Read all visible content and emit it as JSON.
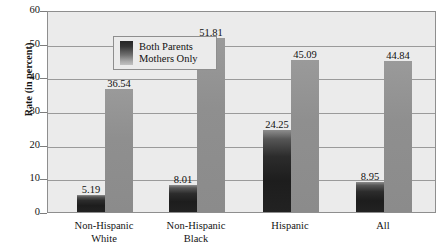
{
  "chart_data": {
    "type": "bar",
    "title": "",
    "xlabel": "",
    "ylabel": "Rate (in percent)",
    "ylim": [
      0,
      60
    ],
    "ytick_labels": [
      "0",
      "10",
      "20",
      "30",
      "40",
      "50",
      "60"
    ],
    "ytick_values": [
      0,
      10,
      20,
      30,
      40,
      50,
      60
    ],
    "grid": true,
    "legend_position": "top-left inside plot",
    "categories": [
      "Non-Hispanic White",
      "Non-Hispanic Black",
      "Hispanic",
      "All"
    ],
    "category_lines": [
      [
        "Non-Hispanic",
        "White"
      ],
      [
        "Non-Hispanic",
        "Black"
      ],
      [
        "Hispanic"
      ],
      [
        "All"
      ]
    ],
    "series": [
      {
        "name": "Both Parents",
        "color": "#1f1f1f",
        "values": [
          5.19,
          8.01,
          24.25,
          8.95
        ],
        "labels": [
          "5.19",
          "8.01",
          "24.25",
          "8.95"
        ]
      },
      {
        "name": "Mothers Only",
        "color": "#8f8f8f",
        "values": [
          36.54,
          51.81,
          45.09,
          44.84
        ],
        "labels": [
          "36.54",
          "51.81",
          "45.09",
          "44.84"
        ]
      }
    ]
  },
  "legend": {
    "entries": [
      "Both Parents",
      "Mothers Only"
    ],
    "swatch_name": "gradient-swatch"
  },
  "colors": {
    "plot_background": "#ebebeb",
    "page_background": "#ffffff",
    "gridline": "#9a9a9a",
    "frame": "#8e8e8e",
    "both_parents": "#1f1f1f",
    "mothers_only": "#8f8f8f",
    "text": "#111111"
  }
}
